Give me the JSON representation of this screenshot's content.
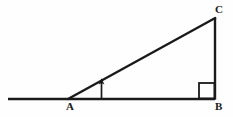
{
  "figure": {
    "name": "right-triangle-with-angle-of-elevation",
    "type": "geometric-diagram",
    "canvas": {
      "width": 233,
      "height": 117
    },
    "background_color": "#fefefe",
    "stroke_color": "#1a1a1a"
  },
  "labels": {
    "vertex_a": "A",
    "vertex_b": "B",
    "vertex_c": "C"
  },
  "points": {
    "A": {
      "x": 68,
      "y": 99
    },
    "B": {
      "x": 215,
      "y": 99
    },
    "C": {
      "x": 215,
      "y": 18
    },
    "ground_left_end": {
      "x": 8,
      "y": 99
    }
  },
  "label_positions": {
    "A": {
      "x": 69,
      "y": 110
    },
    "B": {
      "x": 216,
      "y": 110
    },
    "C": {
      "x": 216,
      "y": 12
    }
  },
  "elements": {
    "ground_line": {
      "x1": 8,
      "y1": 99,
      "x2": 215,
      "y2": 99,
      "width": 2.4
    },
    "hypotenuse": {
      "x1": 68,
      "y1": 99,
      "x2": 215,
      "y2": 18,
      "width": 2.4
    },
    "vertical_leg": {
      "x1": 215,
      "y1": 99,
      "x2": 215,
      "y2": 18,
      "width": 2.4
    },
    "right_angle_marker": {
      "x": 199,
      "y": 83,
      "size": 16,
      "width": 1.8
    },
    "angle_arrow": {
      "x": 101.5,
      "y_base": 98,
      "y_tip": 79,
      "width": 1.6,
      "head_size": 3.6
    }
  }
}
